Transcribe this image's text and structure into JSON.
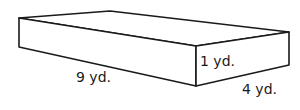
{
  "diagram": {
    "type": "rectangular-prism",
    "labels": {
      "length": "9 yd.",
      "height": "1 yd.",
      "width": "4 yd."
    },
    "vertices": {
      "left_top": [
        19,
        18
      ],
      "left_bottom": [
        19,
        47
      ],
      "back_top": [
        110,
        11
      ],
      "front_top": [
        196,
        46
      ],
      "front_bottom": [
        196,
        86
      ],
      "right_top": [
        289,
        32
      ],
      "right_bottom": [
        289,
        65
      ]
    },
    "stroke_color": "#1a1a1a",
    "fill_color": "#ffffff"
  }
}
